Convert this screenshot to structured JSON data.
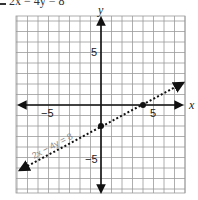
{
  "header": {
    "box_label": "",
    "equation": "2x − 4y = 8"
  },
  "chart_data": {
    "type": "line",
    "title": "2x − 4y = 8",
    "xlabel": "x",
    "ylabel": "y",
    "xlim": [
      -8,
      8
    ],
    "ylim": [
      -8.5,
      8.5
    ],
    "grid": true,
    "x_ticks_labeled": [
      -5,
      5
    ],
    "y_ticks_labeled": [
      5,
      -5
    ],
    "x_tick_labels": [
      "−5",
      "5"
    ],
    "y_tick_labels": [
      "5",
      "−5"
    ],
    "series": [
      {
        "name": "2x − 4y = 8",
        "style": "dotted",
        "equation": "y = 0.5x − 2",
        "points": [
          {
            "x": 0,
            "y": -2
          },
          {
            "x": 4,
            "y": 0
          }
        ],
        "x": [
          -8,
          8
        ],
        "y": [
          -6,
          2
        ]
      }
    ],
    "annotations": [
      "2x − 4y = 8"
    ],
    "legend": null
  },
  "labels": {
    "x_axis": "x",
    "y_axis": "y",
    "x_neg5": "−5",
    "x_pos5": "5",
    "y_pos5": "5",
    "y_neg5": "−5",
    "line_label": "2x − 4y = 8"
  }
}
